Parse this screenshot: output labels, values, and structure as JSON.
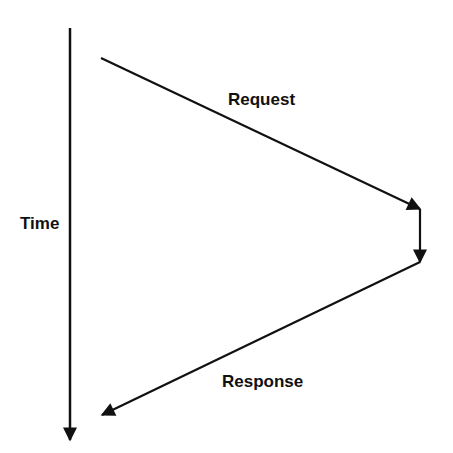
{
  "diagram": {
    "type": "sequence-timing",
    "labels": {
      "time": "Time",
      "request": "Request",
      "response": "Response"
    },
    "colors": {
      "line": "#111111",
      "background": "#ffffff"
    },
    "arrows": [
      {
        "name": "time-axis",
        "from": [
          70,
          28
        ],
        "to": [
          70,
          440
        ]
      },
      {
        "name": "request",
        "from": [
          101,
          58
        ],
        "to": [
          420,
          209
        ]
      },
      {
        "name": "processing",
        "from": [
          420,
          209
        ],
        "to": [
          420,
          262
        ]
      },
      {
        "name": "response",
        "from": [
          420,
          262
        ],
        "to": [
          102,
          415
        ]
      }
    ]
  }
}
